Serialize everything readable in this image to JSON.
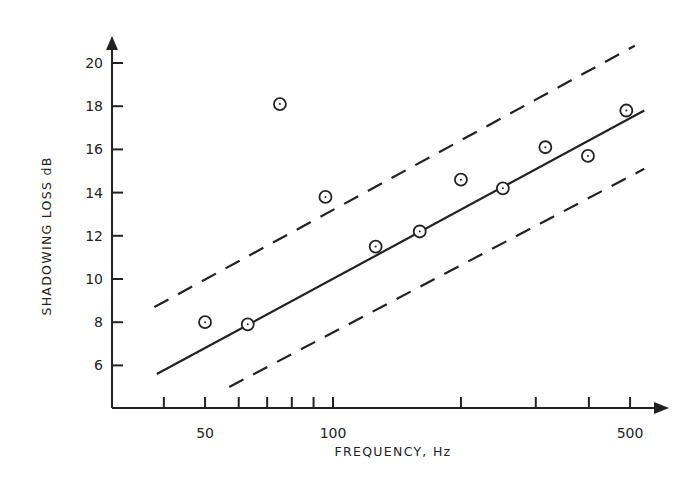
{
  "chart_data": {
    "type": "scatter",
    "title": "",
    "xlabel": "FREQUENCY, Hz",
    "ylabel": "SHADOWING LOSS dB",
    "x_scale": "log",
    "xlim": [
      33,
      560
    ],
    "ylim": [
      4.2,
      21
    ],
    "x_ticks": [
      40,
      50,
      60,
      70,
      80,
      90,
      100,
      200,
      300,
      400,
      500
    ],
    "x_tick_labels": [
      {
        "value": 50,
        "label": "50"
      },
      {
        "value": 100,
        "label": "100"
      },
      {
        "value": 500,
        "label": "500"
      }
    ],
    "y_ticks": [
      6,
      8,
      10,
      12,
      14,
      16,
      18,
      20
    ],
    "y_tick_labels": [
      "6",
      "8",
      "10",
      "12",
      "14",
      "16",
      "18",
      "20"
    ],
    "grid": false,
    "legend": null,
    "series": [
      {
        "name": "Measured",
        "kind": "scatter",
        "marker": "circle-dot",
        "points": [
          {
            "x": 50,
            "y": 8.0
          },
          {
            "x": 63,
            "y": 7.9
          },
          {
            "x": 75,
            "y": 18.1
          },
          {
            "x": 96,
            "y": 13.8
          },
          {
            "x": 126,
            "y": 11.5
          },
          {
            "x": 160,
            "y": 12.2
          },
          {
            "x": 200,
            "y": 14.6
          },
          {
            "x": 251,
            "y": 14.2
          },
          {
            "x": 316,
            "y": 16.1
          },
          {
            "x": 398,
            "y": 15.7
          },
          {
            "x": 490,
            "y": 17.8
          }
        ]
      },
      {
        "name": "Fit",
        "kind": "line",
        "style": "solid",
        "points": [
          {
            "x": 38.5,
            "y": 5.6
          },
          {
            "x": 540,
            "y": 17.8
          }
        ]
      },
      {
        "name": "Upper bound",
        "kind": "line",
        "style": "dashed",
        "points": [
          {
            "x": 38,
            "y": 8.7
          },
          {
            "x": 513,
            "y": 20.8
          }
        ]
      },
      {
        "name": "Lower bound",
        "kind": "line",
        "style": "dashed",
        "points": [
          {
            "x": 57,
            "y": 5.0
          },
          {
            "x": 540,
            "y": 15.1
          }
        ]
      }
    ]
  },
  "colors": {
    "ink": "#222222",
    "background": "#ffffff"
  }
}
